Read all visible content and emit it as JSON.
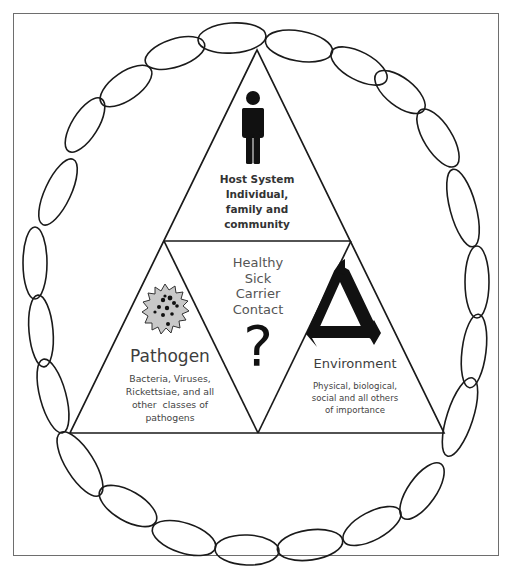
{
  "diagram": {
    "host": {
      "icon": "person-icon",
      "label_lines": [
        "Host System",
        "Individual,",
        "family and",
        "community"
      ]
    },
    "center": {
      "status_lines": [
        "Healthy",
        "Sick",
        "Carrier",
        "Contact"
      ],
      "icon": "question-mark-icon",
      "symbol": "?"
    },
    "pathogen": {
      "icon": "germ-icon",
      "title": "Pathogen",
      "desc_lines": [
        "Bacteria, Viruses,",
        "Rickettsiae, and all",
        "other  classes of",
        "pathogens"
      ]
    },
    "environment": {
      "icon": "cycle-triangle-icon",
      "title": "Environment",
      "desc_lines": [
        "Physical, biological,",
        "social and all others",
        "of importance"
      ]
    },
    "chain": {
      "description": "Oval chain links encircling the triangle",
      "link_count": 26
    },
    "colors": {
      "line": "#1a1a1a",
      "text": "#3a3a3a",
      "frame": "#6e6e6e",
      "germ_fill": "#c8c8c8",
      "background": "#ffffff"
    }
  }
}
